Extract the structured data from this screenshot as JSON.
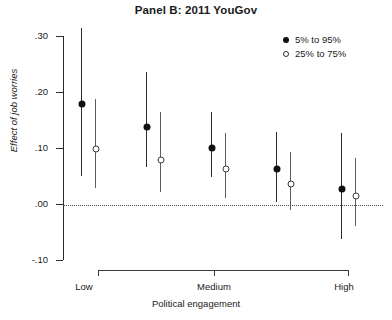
{
  "chart_data": {
    "type": "scatter",
    "title": "Panel B: 2011 YouGov",
    "xlabel": "Political engagement",
    "ylabel": "Effect of job worries",
    "ylim": [
      -0.1,
      0.3
    ],
    "yticks": [
      0.3,
      0.2,
      0.1,
      0.0,
      -0.1
    ],
    "ytick_labels": [
      ".30",
      ".20",
      ".10",
      ".00",
      "-.10"
    ],
    "xticks": [
      0,
      2,
      4
    ],
    "xtick_labels": [
      "Low",
      "Medium",
      "High"
    ],
    "grid": false,
    "zero_reference_line": 0.0,
    "legend_position": "top-right",
    "categories": [
      "Low",
      "",
      "Medium",
      "",
      "High"
    ],
    "series": [
      {
        "name": "5% to 95%",
        "marker": "filled-circle",
        "values": [
          0.178,
          0.138,
          0.1,
          0.062,
          0.026
        ],
        "low": [
          0.05,
          0.066,
          0.048,
          0.003,
          -0.063
        ],
        "high": [
          0.315,
          0.235,
          0.165,
          0.128,
          0.127
        ]
      },
      {
        "name": "25% to 75%",
        "marker": "open-circle",
        "values": [
          0.098,
          0.078,
          0.062,
          0.035,
          0.014
        ],
        "low": [
          0.028,
          0.022,
          0.01,
          -0.01,
          -0.04
        ],
        "high": [
          0.188,
          0.165,
          0.126,
          0.093,
          0.083
        ]
      }
    ]
  },
  "legend": {
    "items": [
      {
        "label": "5% to 95%",
        "marker": "filled-circle"
      },
      {
        "label": "25% to 75%",
        "marker": "open-circle"
      }
    ]
  },
  "colors": {
    "series_filled": "#111111",
    "series_open": "#3a3a3a",
    "axis": "#2b2b2b",
    "background": "#ffffff"
  }
}
